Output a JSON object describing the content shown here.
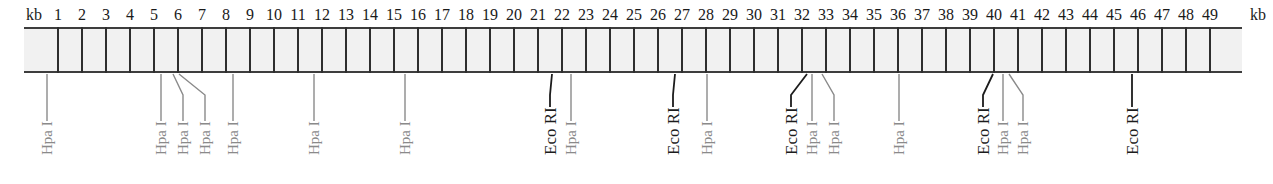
{
  "diagram": {
    "type": "restriction-map",
    "unit_label_left": "kb",
    "unit_label_right": "kb",
    "scale": {
      "ticks": [
        "1",
        "2",
        "3",
        "4",
        "5",
        "6",
        "7",
        "8",
        "9",
        "10",
        "11",
        "12",
        "13",
        "14",
        "15",
        "16",
        "17",
        "18",
        "19",
        "20",
        "21",
        "22",
        "23",
        "24",
        "25",
        "26",
        "27",
        "28",
        "29",
        "30",
        "31",
        "32",
        "33",
        "34",
        "35",
        "36",
        "37",
        "38",
        "39",
        "40",
        "41",
        "42",
        "43",
        "44",
        "45",
        "46",
        "47",
        "48",
        "49"
      ],
      "tick_x_start": 58,
      "tick_spacing_px": 24,
      "band_left": 24,
      "band_right": 1242
    },
    "colors": {
      "band_fill": "#f1f1f1",
      "band_border": "#3d3d3d",
      "hpa_color": "#8a8a8a",
      "eco_color": "#1c1c1c"
    },
    "enzymes": {
      "hpa": "Hpa I",
      "eco": "Eco RI"
    },
    "sites": [
      {
        "enzyme": "hpa",
        "label": "Hpa I",
        "kb": 0.5,
        "x_band": 47,
        "x_label": 47
      },
      {
        "enzyme": "hpa",
        "label": "Hpa I",
        "kb": 5.3,
        "x_band": 161,
        "x_label": 161
      },
      {
        "enzyme": "hpa",
        "label": "Hpa I",
        "kb": 5.8,
        "x_band": 173,
        "x_label": 183
      },
      {
        "enzyme": "hpa",
        "label": "Hpa I",
        "kb": 6.0,
        "x_band": 179,
        "x_label": 205
      },
      {
        "enzyme": "hpa",
        "label": "Hpa I",
        "kb": 8.3,
        "x_band": 233,
        "x_label": 233
      },
      {
        "enzyme": "hpa",
        "label": "Hpa I",
        "kb": 11.7,
        "x_band": 314,
        "x_label": 314
      },
      {
        "enzyme": "hpa",
        "label": "Hpa I",
        "kb": 15.5,
        "x_band": 405,
        "x_label": 405
      },
      {
        "enzyme": "eco",
        "label": "Eco RI",
        "kb": 21.6,
        "x_band": 552,
        "x_label": 550
      },
      {
        "enzyme": "hpa",
        "label": "Hpa I",
        "kb": 22.4,
        "x_band": 571,
        "x_label": 571
      },
      {
        "enzyme": "eco",
        "label": "Eco RI",
        "kb": 26.7,
        "x_band": 675,
        "x_label": 673
      },
      {
        "enzyme": "hpa",
        "label": "Hpa I",
        "kb": 28.0,
        "x_band": 707,
        "x_label": 707
      },
      {
        "enzyme": "eco",
        "label": "Eco RI",
        "kb": 32.2,
        "x_band": 807,
        "x_label": 791
      },
      {
        "enzyme": "hpa",
        "label": "Hpa I",
        "kb": 32.4,
        "x_band": 812,
        "x_label": 812
      },
      {
        "enzyme": "hpa",
        "label": "Hpa I",
        "kb": 32.8,
        "x_band": 822,
        "x_label": 834
      },
      {
        "enzyme": "hpa",
        "label": "Hpa I",
        "kb": 36.0,
        "x_band": 899,
        "x_label": 899
      },
      {
        "enzyme": "eco",
        "label": "Eco RI",
        "kb": 40.0,
        "x_band": 993,
        "x_label": 983
      },
      {
        "enzyme": "hpa",
        "label": "Hpa I",
        "kb": 40.4,
        "x_band": 1003,
        "x_label": 1003
      },
      {
        "enzyme": "hpa",
        "label": "Hpa I",
        "kb": 40.6,
        "x_band": 1009,
        "x_label": 1023
      },
      {
        "enzyme": "eco",
        "label": "Eco RI",
        "kb": 45.75,
        "x_band": 1132,
        "x_label": 1132
      }
    ]
  }
}
